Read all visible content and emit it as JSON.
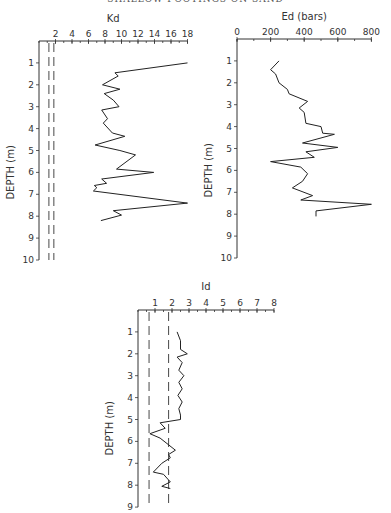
{
  "header": "SHALLOW FOOTINGS ON SAND",
  "chart_data": [
    {
      "type": "line",
      "id": "kd",
      "title": "Kd",
      "xlabel": "Kd",
      "ylabel": "DEPTH (m)",
      "xlim": [
        0,
        18
      ],
      "ylim": [
        10,
        0
      ],
      "x_ticks": [
        2,
        4,
        6,
        8,
        10,
        12,
        14,
        16,
        18
      ],
      "x_minor_step": 1,
      "y_ticks": [
        1,
        2,
        3,
        4,
        5,
        6,
        7,
        8,
        9,
        10
      ],
      "reference_lines": [
        1.2,
        1.8
      ],
      "series": [
        {
          "name": "Kd",
          "x": [
            18.0,
            9.2,
            9.6,
            7.7,
            9.8,
            7.9,
            9.0,
            9.7,
            7.6,
            8.3,
            7.8,
            8.9,
            10.4,
            6.8,
            9.8,
            11.7,
            9.4,
            13.9,
            7.6,
            8.2,
            6.7,
            7.0,
            6.6,
            18.0,
            9.0,
            10.0,
            7.5
          ],
          "y": [
            1.0,
            1.45,
            1.6,
            2.0,
            2.2,
            2.4,
            2.7,
            3.0,
            3.15,
            3.55,
            3.75,
            4.2,
            4.35,
            4.75,
            5.0,
            5.2,
            5.85,
            6.0,
            6.3,
            6.5,
            6.6,
            6.7,
            6.85,
            7.4,
            7.75,
            7.95,
            8.2
          ]
        }
      ]
    },
    {
      "type": "line",
      "id": "ed",
      "title": "Ed (bars)",
      "xlabel": "Ed (bars)",
      "ylabel": "DEPTH (m)",
      "xlim": [
        0,
        800
      ],
      "ylim": [
        10,
        0
      ],
      "x_ticks": [
        0,
        200,
        400,
        600,
        800
      ],
      "x_minor_step": 100,
      "y_ticks": [
        1,
        2,
        3,
        4,
        5,
        6,
        7,
        8,
        9,
        10
      ],
      "reference_lines": [],
      "series": [
        {
          "name": "Ed",
          "x": [
            250,
            200,
            230,
            250,
            300,
            310,
            420,
            370,
            400,
            410,
            500,
            510,
            580,
            390,
            600,
            410,
            460,
            200,
            380,
            420,
            390,
            330,
            450,
            380,
            800,
            470,
            470
          ],
          "y": [
            1.0,
            1.4,
            1.6,
            2.0,
            2.3,
            2.5,
            2.85,
            3.15,
            3.35,
            3.85,
            4.0,
            4.3,
            4.35,
            4.75,
            4.95,
            5.15,
            5.4,
            5.6,
            5.85,
            6.15,
            6.5,
            6.8,
            7.15,
            7.35,
            7.55,
            7.85,
            8.1
          ]
        }
      ]
    },
    {
      "type": "line",
      "id": "id",
      "title": "Id",
      "xlabel": "Id",
      "ylabel": "DEPTH (m)",
      "xlim": [
        0,
        8
      ],
      "ylim": [
        9,
        0
      ],
      "x_ticks": [
        1,
        2,
        3,
        4,
        5,
        6,
        7,
        8
      ],
      "x_minor_step": 0.5,
      "y_ticks": [
        1,
        2,
        3,
        4,
        5,
        6,
        7,
        8,
        9
      ],
      "reference_lines": [
        0.65,
        1.8
      ],
      "series": [
        {
          "name": "Id",
          "x": [
            2.3,
            2.5,
            2.5,
            2.9,
            2.3,
            2.6,
            2.4,
            2.7,
            2.4,
            2.6,
            2.35,
            2.6,
            2.4,
            2.5,
            2.5,
            1.3,
            1.6,
            0.7,
            1.3,
            2.2,
            1.8,
            1.9,
            1.4,
            0.9,
            1.5,
            1.9,
            1.4,
            1.9
          ],
          "y": [
            1.0,
            1.4,
            1.8,
            2.0,
            2.15,
            2.4,
            2.75,
            3.0,
            3.3,
            3.6,
            3.9,
            4.2,
            4.5,
            4.8,
            5.0,
            5.15,
            5.4,
            5.65,
            5.85,
            6.4,
            6.6,
            6.75,
            7.0,
            7.4,
            7.5,
            7.85,
            8.05,
            8.15
          ]
        }
      ]
    }
  ]
}
